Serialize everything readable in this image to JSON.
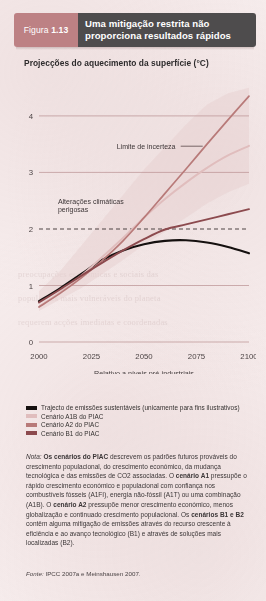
{
  "banner": {
    "tag_prefix": "Figura",
    "figure_number": "1.13",
    "title": "Uma mitigação restrita não proporciona resultados rápidos",
    "tag_color": "#bd8184",
    "title_bg_color": "#4e4c4d"
  },
  "chart_data": {
    "type": "line",
    "title": "Projecções do aquecimento da superfície (°C)",
    "xlabel": "Relativo a níveis pré-industriais",
    "ylabel": "",
    "xlim": [
      2000,
      2100
    ],
    "ylim": [
      0,
      4.6
    ],
    "xticks": [
      "2000",
      "2025",
      "2050",
      "2075",
      "2100"
    ],
    "yticks": [
      "0",
      "1",
      "2",
      "3",
      "4"
    ],
    "grid": true,
    "legend_position": "below",
    "x": [
      2000,
      2010,
      2020,
      2030,
      2040,
      2050,
      2060,
      2070,
      2080,
      2090,
      2100
    ],
    "series": [
      {
        "name": "Trajecto de emissões sustentáveis (unicamente para fins ilustrativos)",
        "short_name": "sustainable-emissions-path",
        "color": "#15100f",
        "values": [
          0.72,
          0.95,
          1.2,
          1.45,
          1.62,
          1.73,
          1.79,
          1.8,
          1.76,
          1.68,
          1.57
        ]
      },
      {
        "name": "Cenário A1B do PIAC",
        "short_name": "ipcc-a1b",
        "color": "#e0bdbd",
        "values": [
          0.62,
          0.88,
          1.17,
          1.5,
          1.84,
          2.2,
          2.53,
          2.82,
          3.08,
          3.3,
          3.47
        ]
      },
      {
        "name": "Cenário A2 do PIAC",
        "short_name": "ipcc-a2",
        "color": "#b87a79",
        "values": [
          0.62,
          0.86,
          1.13,
          1.44,
          1.79,
          2.2,
          2.63,
          3.06,
          3.5,
          3.93,
          4.35
        ]
      },
      {
        "name": "Cenário B1 do PIAC",
        "short_name": "ipcc-b1",
        "color": "#8c4a4e",
        "values": [
          0.7,
          0.93,
          1.17,
          1.4,
          1.62,
          1.82,
          1.99,
          2.08,
          2.17,
          2.26,
          2.35
        ]
      }
    ],
    "uncertainty_band": {
      "label": "Limite de incerteza",
      "color": "#e8d2d2",
      "upper": [
        0.9,
        1.25,
        1.7,
        2.15,
        2.6,
        3.05,
        3.45,
        3.85,
        4.2,
        4.4,
        4.5
      ],
      "lower": [
        0.55,
        0.75,
        0.95,
        1.2,
        1.45,
        1.72,
        1.95,
        2.2,
        2.45,
        2.65,
        2.8
      ]
    },
    "annotations": [
      {
        "name": "uncertainty-limit",
        "text": "Limite de incerteza",
        "x": 0.37,
        "y": 3.42
      },
      {
        "name": "dangerous-climate-change",
        "line1": "Alterações climáticas",
        "line2": "perigosas",
        "x": 0.09,
        "y": 2.45
      }
    ],
    "threshold_line": {
      "name": "dangerous-threshold",
      "value": 2,
      "style": "dashed",
      "color": "#4e4445"
    }
  },
  "legend": [
    {
      "label": "Trajecto de emissões sustentáveis (unicamente para fins ilustrativos)",
      "color": "#15100f"
    },
    {
      "label": "Cenário A1B do PIAC",
      "color": "#e0bdbd"
    },
    {
      "label": "Cenário A2 do PIAC",
      "color": "#b87a79"
    },
    {
      "label": "Cenário B1 do PIAC",
      "color": "#8c4a4e"
    }
  ],
  "note": {
    "label": "Nota:",
    "lead_bold": "Os cenários do PIAC",
    "text_1": " descrevem os padrões futuros prováveis do crescimento populacional, do crescimento económico, da mudança tecnológica e das emissões de CO2 associadas. O ",
    "bold_2": "cenário A1",
    "text_2": " pressupõe o rápido crescimento económico e populacional com confiança nos combustíveis fósseis (A1FI), energia não-fóssil (A1T) ou uma combinação (A1B). O ",
    "bold_3": "cenário A2",
    "text_3": " pressupõe menor crescimento económico, menos globalização e continuado crescimento populacional. Os ",
    "bold_4": "cenários B1 e B2",
    "text_4": " contêm alguma mitigação de emissões através do recurso crescente à eficiência e ao avanço tecnológico (B1) e através de soluções mais localizadas (B2)."
  },
  "source": {
    "label": "Fonte:",
    "text": " IPCC 2007a e Meinshausen 2007."
  },
  "bleed_text": {
    "line_a": "preocupações económicas e sociais das",
    "line_b": "populações mais vulneráveis do planeta",
    "line_c": "requerem acções imediatas e coordenadas"
  }
}
